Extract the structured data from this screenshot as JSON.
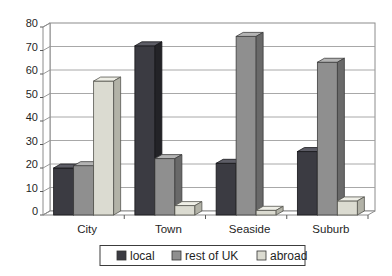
{
  "chart_data": {
    "type": "bar",
    "subtype": "3d-column-grouped",
    "title": "",
    "xlabel": "",
    "ylabel": "",
    "categories": [
      "City",
      "Town",
      "Seaside",
      "Suburb"
    ],
    "series": [
      {
        "name": "local",
        "values": [
          20,
          72,
          22,
          27
        ],
        "color": "#3b3b42",
        "color_top": "#5d5d66",
        "color_side": "#232327",
        "edge": "#17171a"
      },
      {
        "name": "rest of UK",
        "values": [
          21,
          24,
          76,
          65
        ],
        "color": "#8f8f8f",
        "color_top": "#b4b4b4",
        "color_side": "#696969",
        "edge": "#3e3e3e"
      },
      {
        "name": "abroad",
        "values": [
          57,
          4,
          2,
          6
        ],
        "color": "#dbdbd1",
        "color_top": "#efefe7",
        "color_side": "#b2b2a7",
        "edge": "#55554f"
      }
    ],
    "ylim": [
      0,
      80
    ],
    "ytick_step": 10,
    "yticks": [
      "0",
      "10",
      "20",
      "30",
      "40",
      "50",
      "60",
      "70",
      "80"
    ],
    "grid": true,
    "legend_position": "bottom"
  },
  "colors": {
    "background": "#ffffff",
    "wall_fill": "#ffffff",
    "wall_border": "#8c8c8c",
    "gridline": "#9e9e9e",
    "axis_tick": "#5a5a5a",
    "text": "#1f1f1f",
    "legend_border": "#3c3c3c",
    "legend_fill": "#ffffff"
  }
}
